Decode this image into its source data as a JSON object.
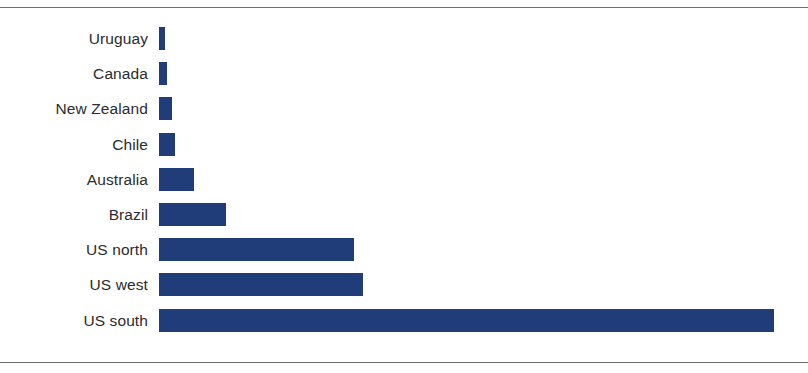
{
  "chart_data": {
    "type": "bar",
    "orientation": "horizontal",
    "title": "",
    "subtitle": "",
    "xlabel": "",
    "ylabel": "",
    "categories": [
      "Uruguay",
      "Canada",
      "New Zealand",
      "Chile",
      "Australia",
      "Brazil",
      "US north",
      "US west",
      "US south"
    ],
    "values": [
      6,
      8,
      13,
      16,
      35,
      67,
      195,
      204,
      615
    ],
    "value_unit": "relative length (px)",
    "xlim": [
      0,
      650
    ],
    "ylim": null,
    "grid": false,
    "legend": null,
    "legend_position": "none",
    "annotations": [],
    "tick_labels": {
      "x": [],
      "y": [
        "Uruguay",
        "Canada",
        "New Zealand",
        "Chile",
        "Australia",
        "Brazil",
        "US north",
        "US west",
        "US south"
      ]
    },
    "series": [
      {
        "name": "",
        "color": "#203d79",
        "values": [
          6,
          8,
          13,
          16,
          35,
          67,
          195,
          204,
          615
        ]
      }
    ]
  },
  "style": {
    "bar_color": "#203d79",
    "label_color": "#2b2b2e",
    "rule_color": "#6e6e72",
    "background": "#ffffff"
  },
  "frame": {
    "top_rule_name": "top-border-rule",
    "bottom_rule_name": "bottom-border-rule"
  }
}
